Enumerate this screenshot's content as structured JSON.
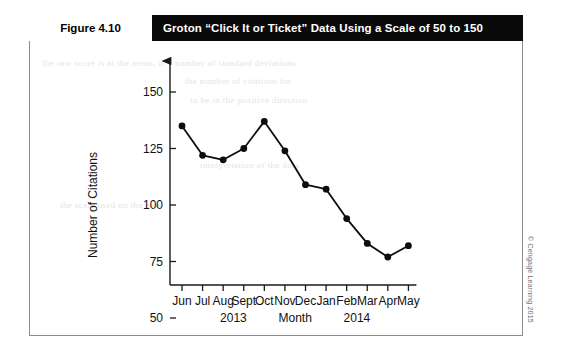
{
  "figure": {
    "number": "Figure 4.10",
    "title": "Groton “Click It or Ticket” Data Using a Scale of 50 to 150"
  },
  "credit": "© Cengage Learning 2015",
  "ghost": {
    "line1": "the raw score is at the mean, it",
    "line2": "number of standard deviations",
    "line3": "the number of citations for",
    "line4": "to be in the positive direction",
    "line5": "interpretation of the data",
    "line6": "the scale used on the axis"
  },
  "chart_data": {
    "type": "line",
    "title": "Groton “Click It or Ticket” Data Using a Scale of 50 to 150",
    "xlabel": "Month",
    "ylabel": "Number of Citations",
    "categories": [
      "Jun",
      "Jul",
      "Aug",
      "Sept",
      "Oct",
      "Nov",
      "Dec",
      "Jan",
      "Feb",
      "Mar",
      "Apr",
      "May"
    ],
    "values": [
      135,
      122,
      120,
      125,
      137,
      124,
      109,
      107,
      94,
      83,
      77,
      82
    ],
    "ylim": [
      50,
      150
    ],
    "yticks": [
      50,
      75,
      100,
      125,
      150
    ],
    "ytick_labels": [
      "50",
      "75",
      "100",
      "125",
      "150"
    ],
    "grid": false,
    "legend": false,
    "marker": "filled-circle",
    "line_color": "#0d0d0d",
    "group_labels": [
      {
        "text": "2013",
        "after_category": "Aug"
      },
      {
        "text": "2014",
        "after_category": "Feb"
      }
    ],
    "year_2013": "2013",
    "year_2014": "2014"
  }
}
